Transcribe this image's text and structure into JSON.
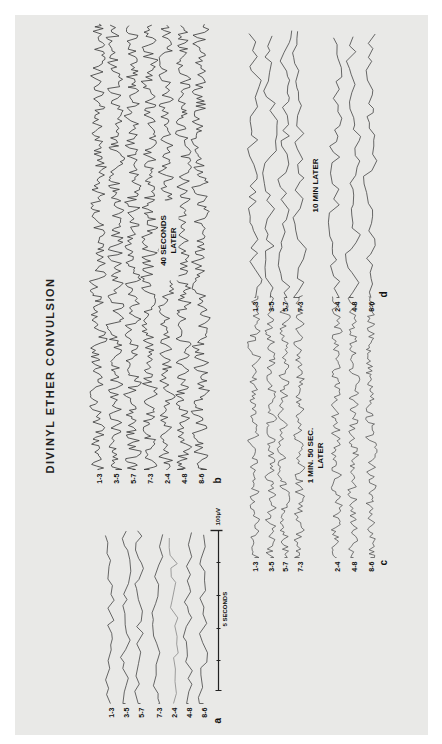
{
  "figure": {
    "title": "DIVINYL ETHER CONVULSION",
    "orientation": "rotated 90° counter-clockwise on page",
    "channels": [
      "1-3",
      "3-5",
      "5-7",
      "7-3",
      "2-4",
      "4-8",
      "8-6"
    ],
    "panels": [
      {
        "id": "a",
        "label": "a",
        "note": "",
        "activity": "slow"
      },
      {
        "id": "b",
        "label": "b",
        "note_line1": "40 SECONDS",
        "note_line2": "LATER",
        "activity": "fast-convulsive"
      },
      {
        "id": "c",
        "label": "c",
        "note_line1": "1 MIN. 50 SEC.",
        "note_line2": "LATER",
        "activity": "fast"
      },
      {
        "id": "d",
        "label": "d",
        "note_line1": "10 MIN LATER",
        "note_line2": "",
        "activity": "slow"
      }
    ],
    "scale_bar": {
      "time_label": "5 SECONDS",
      "amplitude_label": "100µV"
    }
  },
  "colors": {
    "page": "#e9e9e7",
    "ink": "#222222"
  }
}
